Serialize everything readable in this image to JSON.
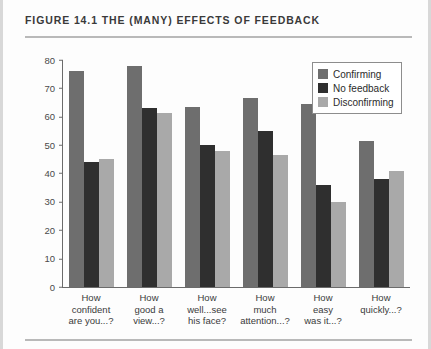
{
  "figure": {
    "title": "FIGURE 14.1   THE (MANY) EFFECTS OF FEEDBACK"
  },
  "chart_data": {
    "type": "bar",
    "title": "THE (MANY) EFFECTS OF FEEDBACK",
    "xlabel": "",
    "ylabel": "",
    "ylim": [
      0,
      80
    ],
    "yticks": [
      0,
      10,
      20,
      30,
      40,
      50,
      60,
      70,
      80
    ],
    "grid": false,
    "legend_position": "top-right",
    "categories": [
      "How confident are you...?",
      "How good a view...?",
      "How well...see his face?",
      "How much attention...?",
      "How easy was it...?",
      "How quickly...?"
    ],
    "category_lines": [
      [
        "How",
        "confident",
        "are you...?"
      ],
      [
        "How",
        "good a",
        "view...?"
      ],
      [
        "How",
        "well...see",
        "his face?"
      ],
      [
        "How",
        "much",
        "attention...?"
      ],
      [
        "How",
        "easy",
        "was it...?"
      ],
      [
        "How",
        "quickly...?"
      ]
    ],
    "series": [
      {
        "name": "Confirming",
        "color": "#6e6e6e",
        "values": [
          76,
          78,
          63.5,
          66.5,
          64.5,
          51.5
        ]
      },
      {
        "name": "No feedback",
        "color": "#2f2f2f",
        "values": [
          44,
          63,
          50,
          55,
          36,
          38
        ]
      },
      {
        "name": "Disconfirming",
        "color": "#a9a9a9",
        "values": [
          45,
          61.5,
          48,
          46.5,
          30,
          41
        ]
      }
    ]
  }
}
